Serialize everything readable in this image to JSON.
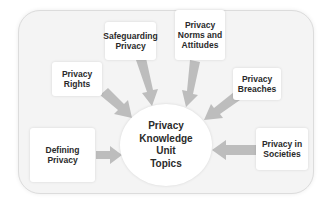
{
  "diagram": {
    "center": {
      "label": "Privacy\nKnowledge\nUnit\nTopics"
    },
    "topics": [
      {
        "id": "defining-privacy",
        "label": "Defining Privacy"
      },
      {
        "id": "privacy-rights",
        "label": "Privacy\nRights"
      },
      {
        "id": "safeguarding-privacy",
        "label": "Safeguarding\nPrivacy"
      },
      {
        "id": "privacy-norms-and-attitudes",
        "label": "Privacy\nNorms and\nAttitudes"
      },
      {
        "id": "privacy-breaches",
        "label": "Privacy\nBreaches"
      },
      {
        "id": "privacy-in-societies",
        "label": "Privacy in\nSocieties"
      }
    ],
    "colors": {
      "arrow": "#bdbdbd",
      "frame": "#f4f4f4",
      "box": "#ffffff",
      "text": "#2a2a2a"
    }
  }
}
